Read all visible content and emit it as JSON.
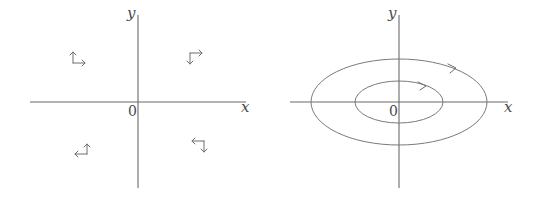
{
  "left_panel": {
    "axis_labels": {
      "x": "x",
      "y": "y",
      "origin": "0"
    },
    "quadrant_glyphs": [
      {
        "quadrant": "top-left",
        "icon": "up-and-right-corner-arrows"
      },
      {
        "quadrant": "top-right",
        "icon": "down-and-right-corner-arrows"
      },
      {
        "quadrant": "bottom-left",
        "icon": "up-and-left-corner-arrows"
      },
      {
        "quadrant": "bottom-right",
        "icon": "left-and-down-corner-arrows"
      }
    ]
  },
  "right_panel": {
    "axis_labels": {
      "x": "x",
      "y": "y",
      "origin": "0"
    },
    "orbits": [
      {
        "name": "outer-ellipse",
        "rx": 88,
        "ry": 43,
        "direction": "clockwise"
      },
      {
        "name": "inner-ellipse",
        "rx": 44,
        "ry": 21,
        "direction": "clockwise"
      }
    ]
  },
  "colors": {
    "line": "#6a6a6a",
    "text": "#4a4a4a",
    "background": "#ffffff"
  }
}
